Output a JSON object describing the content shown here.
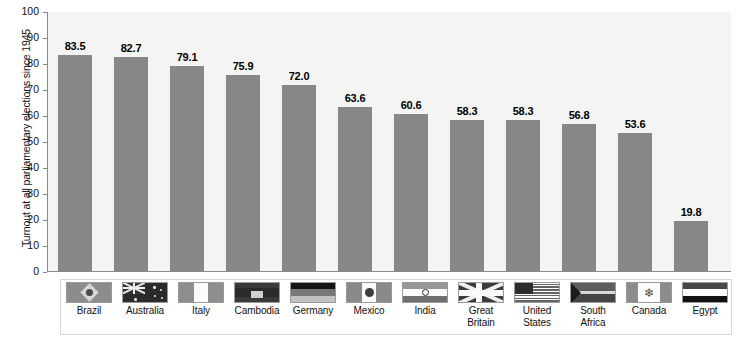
{
  "chart_data": {
    "type": "bar",
    "title": "",
    "xlabel": "",
    "ylabel": "Turnout at all parliamentary elections since 1945",
    "ylim": [
      0,
      100
    ],
    "yticks": [
      "100",
      "90",
      "80",
      "70",
      "60",
      "50",
      "40",
      "30",
      "20",
      "10",
      "0"
    ],
    "grid": false,
    "legend": "none",
    "bar_color": "#878787",
    "categories": [
      "Brazil",
      "Australia",
      "Italy",
      "Cambodia",
      "Germany",
      "Mexico",
      "India",
      "Great Britain",
      "United States",
      "South Africa",
      "Canada",
      "Egypt"
    ],
    "values": [
      83.5,
      82.7,
      79.1,
      75.9,
      72.0,
      63.6,
      60.6,
      58.3,
      58.3,
      56.8,
      53.6,
      19.8
    ],
    "value_labels": [
      "83.5",
      "82.7",
      "79.1",
      "75.9",
      "72.0",
      "63.6",
      "60.6",
      "58.3",
      "58.3",
      "56.8",
      "53.6",
      "19.8"
    ]
  },
  "legend_strip": {
    "items": [
      {
        "label_line1": "Brazil",
        "label_line2": "",
        "flag": "brazil-flag"
      },
      {
        "label_line1": "Australia",
        "label_line2": "",
        "flag": "australia-flag"
      },
      {
        "label_line1": "Italy",
        "label_line2": "",
        "flag": "italy-flag"
      },
      {
        "label_line1": "Cambodia",
        "label_line2": "",
        "flag": "cambodia-flag"
      },
      {
        "label_line1": "Germany",
        "label_line2": "",
        "flag": "germany-flag"
      },
      {
        "label_line1": "Mexico",
        "label_line2": "",
        "flag": "mexico-flag"
      },
      {
        "label_line1": "India",
        "label_line2": "",
        "flag": "india-flag"
      },
      {
        "label_line1": "Great",
        "label_line2": "Britain",
        "flag": "great-britain-flag"
      },
      {
        "label_line1": "United",
        "label_line2": "States",
        "flag": "united-states-flag"
      },
      {
        "label_line1": "South",
        "label_line2": "Africa",
        "flag": "south-africa-flag"
      },
      {
        "label_line1": "Canada",
        "label_line2": "",
        "flag": "canada-flag"
      },
      {
        "label_line1": "Egypt",
        "label_line2": "",
        "flag": "egypt-flag"
      }
    ]
  },
  "icons": {
    "maple_leaf": "⭐"
  }
}
